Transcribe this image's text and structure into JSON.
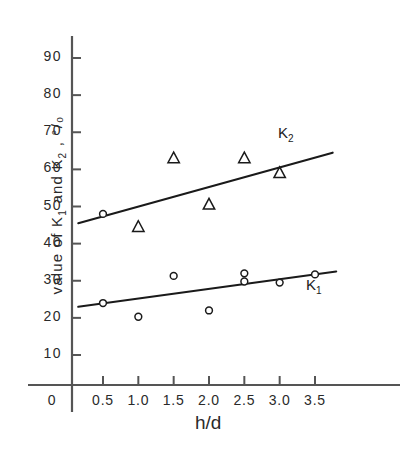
{
  "chart_data": {
    "type": "scatter",
    "title": "",
    "xlabel": "h/d",
    "ylabel": "value of K₁ and K₂ , °/₀",
    "ylabel_parts": {
      "prefix": "value of K",
      "sub1": "1",
      "middle": " and K",
      "sub2": "2",
      "suffix": " , °/₀"
    },
    "xlim": [
      0,
      3.9
    ],
    "ylim": [
      0,
      95
    ],
    "grid": false,
    "legend_position": "inline-right",
    "xticks": [
      0,
      0.5,
      1.0,
      1.5,
      2.0,
      2.5,
      3.0,
      3.5
    ],
    "xticklabels": [
      "0",
      "0.5",
      "1.0",
      "1.5",
      "2.0",
      "2.5",
      "3.0",
      "3.5"
    ],
    "yticks": [
      10,
      20,
      30,
      40,
      50,
      60,
      70,
      80,
      90
    ],
    "yticklabels": [
      "10",
      "20",
      "30",
      "40",
      "50",
      "60",
      "70",
      "80",
      "90"
    ],
    "series": [
      {
        "name": "K2",
        "label": "K",
        "label_sub": "2",
        "marker": "triangle",
        "points": [
          {
            "x": 0.5,
            "y": 48.0,
            "marker": "circle"
          },
          {
            "x": 1.0,
            "y": 44.5,
            "marker": "triangle"
          },
          {
            "x": 1.5,
            "y": 63.0,
            "marker": "triangle"
          },
          {
            "x": 2.0,
            "y": 50.5,
            "marker": "triangle"
          },
          {
            "x": 2.5,
            "y": 63.0,
            "marker": "triangle"
          },
          {
            "x": 3.0,
            "y": 59.0,
            "marker": "triangle"
          }
        ],
        "fit_line": {
          "x1": 0.15,
          "y1": 45.5,
          "x2": 3.75,
          "y2": 64.5
        }
      },
      {
        "name": "K1",
        "label": "K",
        "label_sub": "1",
        "marker": "circle",
        "points": [
          {
            "x": 0.5,
            "y": 24.0,
            "marker": "circle"
          },
          {
            "x": 1.0,
            "y": 20.3,
            "marker": "circle"
          },
          {
            "x": 1.5,
            "y": 31.3,
            "marker": "circle"
          },
          {
            "x": 2.0,
            "y": 22.0,
            "marker": "circle"
          },
          {
            "x": 2.5,
            "y": 32.0,
            "marker": "circle"
          },
          {
            "x": 2.5,
            "y": 29.8,
            "marker": "circle"
          },
          {
            "x": 3.0,
            "y": 29.5,
            "marker": "circle"
          },
          {
            "x": 3.5,
            "y": 31.7,
            "marker": "circle"
          }
        ],
        "fit_line": {
          "x1": 0.15,
          "y1": 23.0,
          "x2": 3.8,
          "y2": 32.5
        }
      }
    ],
    "colors": {
      "ink": "#1a1a1a",
      "axis": "#555555",
      "background": "#ffffff"
    }
  }
}
